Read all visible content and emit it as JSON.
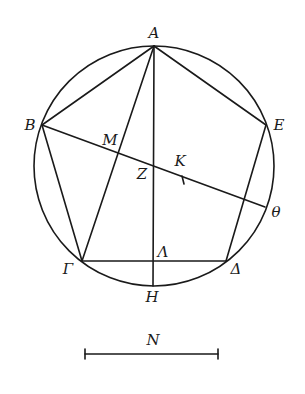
{
  "diagram": {
    "type": "geometric-construction",
    "circle": {
      "cx": 154,
      "cy": 166,
      "r": 120
    },
    "points": {
      "A": {
        "label": "A",
        "x": 154,
        "y": 46,
        "lx": 154,
        "ly": 38
      },
      "B": {
        "label": "B",
        "x": 42,
        "y": 125,
        "lx": 30,
        "ly": 130
      },
      "E": {
        "label": "E",
        "x": 266,
        "y": 125,
        "lx": 279,
        "ly": 130
      },
      "Gamma": {
        "label": "Γ",
        "x": 82,
        "y": 261,
        "lx": 68,
        "ly": 274
      },
      "Delta": {
        "label": "Δ",
        "x": 226,
        "y": 261,
        "lx": 236,
        "ly": 274
      },
      "Theta": {
        "label": "θ",
        "x": 265,
        "y": 207,
        "lx": 276,
        "ly": 217
      },
      "H": {
        "label": "H",
        "x": 153,
        "y": 286,
        "lx": 152,
        "ly": 302
      },
      "Lambda": {
        "label": "Λ",
        "x": 153,
        "y": 261,
        "lx": 163,
        "ly": 257
      },
      "Z": {
        "label": "Z",
        "x": 153,
        "y": 165,
        "lx": 142,
        "ly": 179
      },
      "M": {
        "label": "M",
        "x": 118,
        "y": 152,
        "lx": 110,
        "ly": 145
      },
      "K": {
        "label": "K",
        "x": 183,
        "y": 180,
        "lx": 180,
        "ly": 166
      }
    },
    "segments": [
      [
        "A",
        "B"
      ],
      [
        "A",
        "E"
      ],
      [
        "B",
        "Gamma"
      ],
      [
        "E",
        "Delta"
      ],
      [
        "Gamma",
        "Delta"
      ],
      [
        "A",
        "H"
      ],
      [
        "A",
        "Gamma"
      ],
      [
        "B",
        "Theta"
      ]
    ],
    "scale_bar": {
      "label": "N",
      "x1": 85,
      "x2": 218,
      "y": 354,
      "lx": 153,
      "ly": 345
    }
  }
}
